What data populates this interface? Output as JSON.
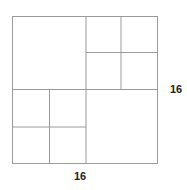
{
  "diagram": {
    "line_color": "#9a9a9a",
    "labels": {
      "width": "16",
      "height": "16"
    },
    "quadrants": [
      {
        "name": "top-left",
        "subdivided": false
      },
      {
        "name": "top-right",
        "subdivided": true,
        "parts": 4
      },
      {
        "name": "bottom-left",
        "subdivided": true,
        "parts": 4
      },
      {
        "name": "bottom-right",
        "subdivided": false
      }
    ]
  }
}
